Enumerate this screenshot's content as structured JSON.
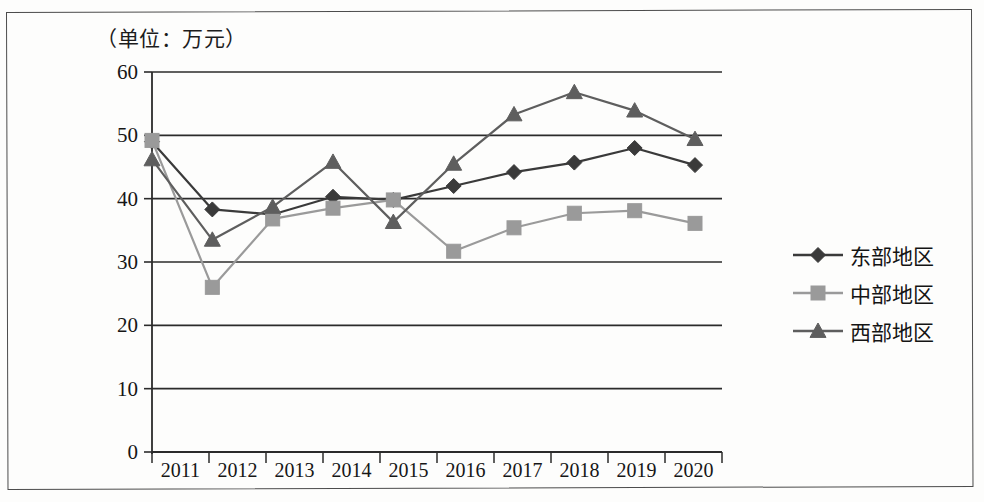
{
  "unit_label": "（单位：万元）",
  "chart_data": {
    "type": "line",
    "title": "",
    "subtitle": "",
    "xlabel": "",
    "ylabel": "",
    "unit_note": "（单位：万元）",
    "categories": [
      "2011",
      "2012",
      "2013",
      "2014",
      "2015",
      "2016",
      "2017",
      "2018",
      "2019",
      "2020"
    ],
    "ylim": [
      0,
      60
    ],
    "yticks": [
      "0",
      "10",
      "20",
      "30",
      "40",
      "50",
      "60"
    ],
    "ytick_values": [
      0,
      10,
      20,
      30,
      40,
      50,
      60
    ],
    "grid": "horizontal",
    "legend_position": "right",
    "series": [
      {
        "name": "东部地区",
        "marker": "diamond",
        "color": "#3a3a3a",
        "values": [
          49.0,
          38.3,
          37.5,
          40.3,
          39.8,
          42.0,
          44.2,
          45.7,
          48.0,
          45.3
        ]
      },
      {
        "name": "中部地区",
        "marker": "square",
        "color": "#9a9a9a",
        "values": [
          49.2,
          26.0,
          36.8,
          38.5,
          39.8,
          31.7,
          35.4,
          37.7,
          38.1,
          36.1
        ]
      },
      {
        "name": "西部地区",
        "marker": "triangle",
        "color": "#5e5e5e",
        "values": [
          46.2,
          33.5,
          38.7,
          45.8,
          36.3,
          45.5,
          53.3,
          56.8,
          53.9,
          49.4
        ]
      }
    ]
  },
  "axis_color": "#2b2b2b",
  "frame_color": "#4c4c4c"
}
